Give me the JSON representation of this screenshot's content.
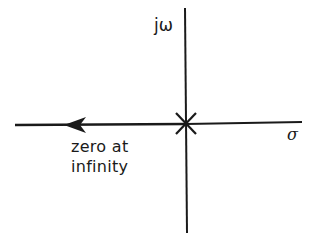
{
  "diagram": {
    "type": "s-plane root locus",
    "axes": {
      "vertical_label": "jω",
      "horizontal_label": "σ"
    },
    "pole": {
      "symbol": "×",
      "location": "origin"
    },
    "locus": {
      "direction": "left along negative real axis",
      "arrow": "left"
    },
    "annotation": {
      "line1": "zero at",
      "line2": "infinity"
    },
    "colors": {
      "line": "#1a1a1a",
      "background": "#ffffff"
    }
  }
}
